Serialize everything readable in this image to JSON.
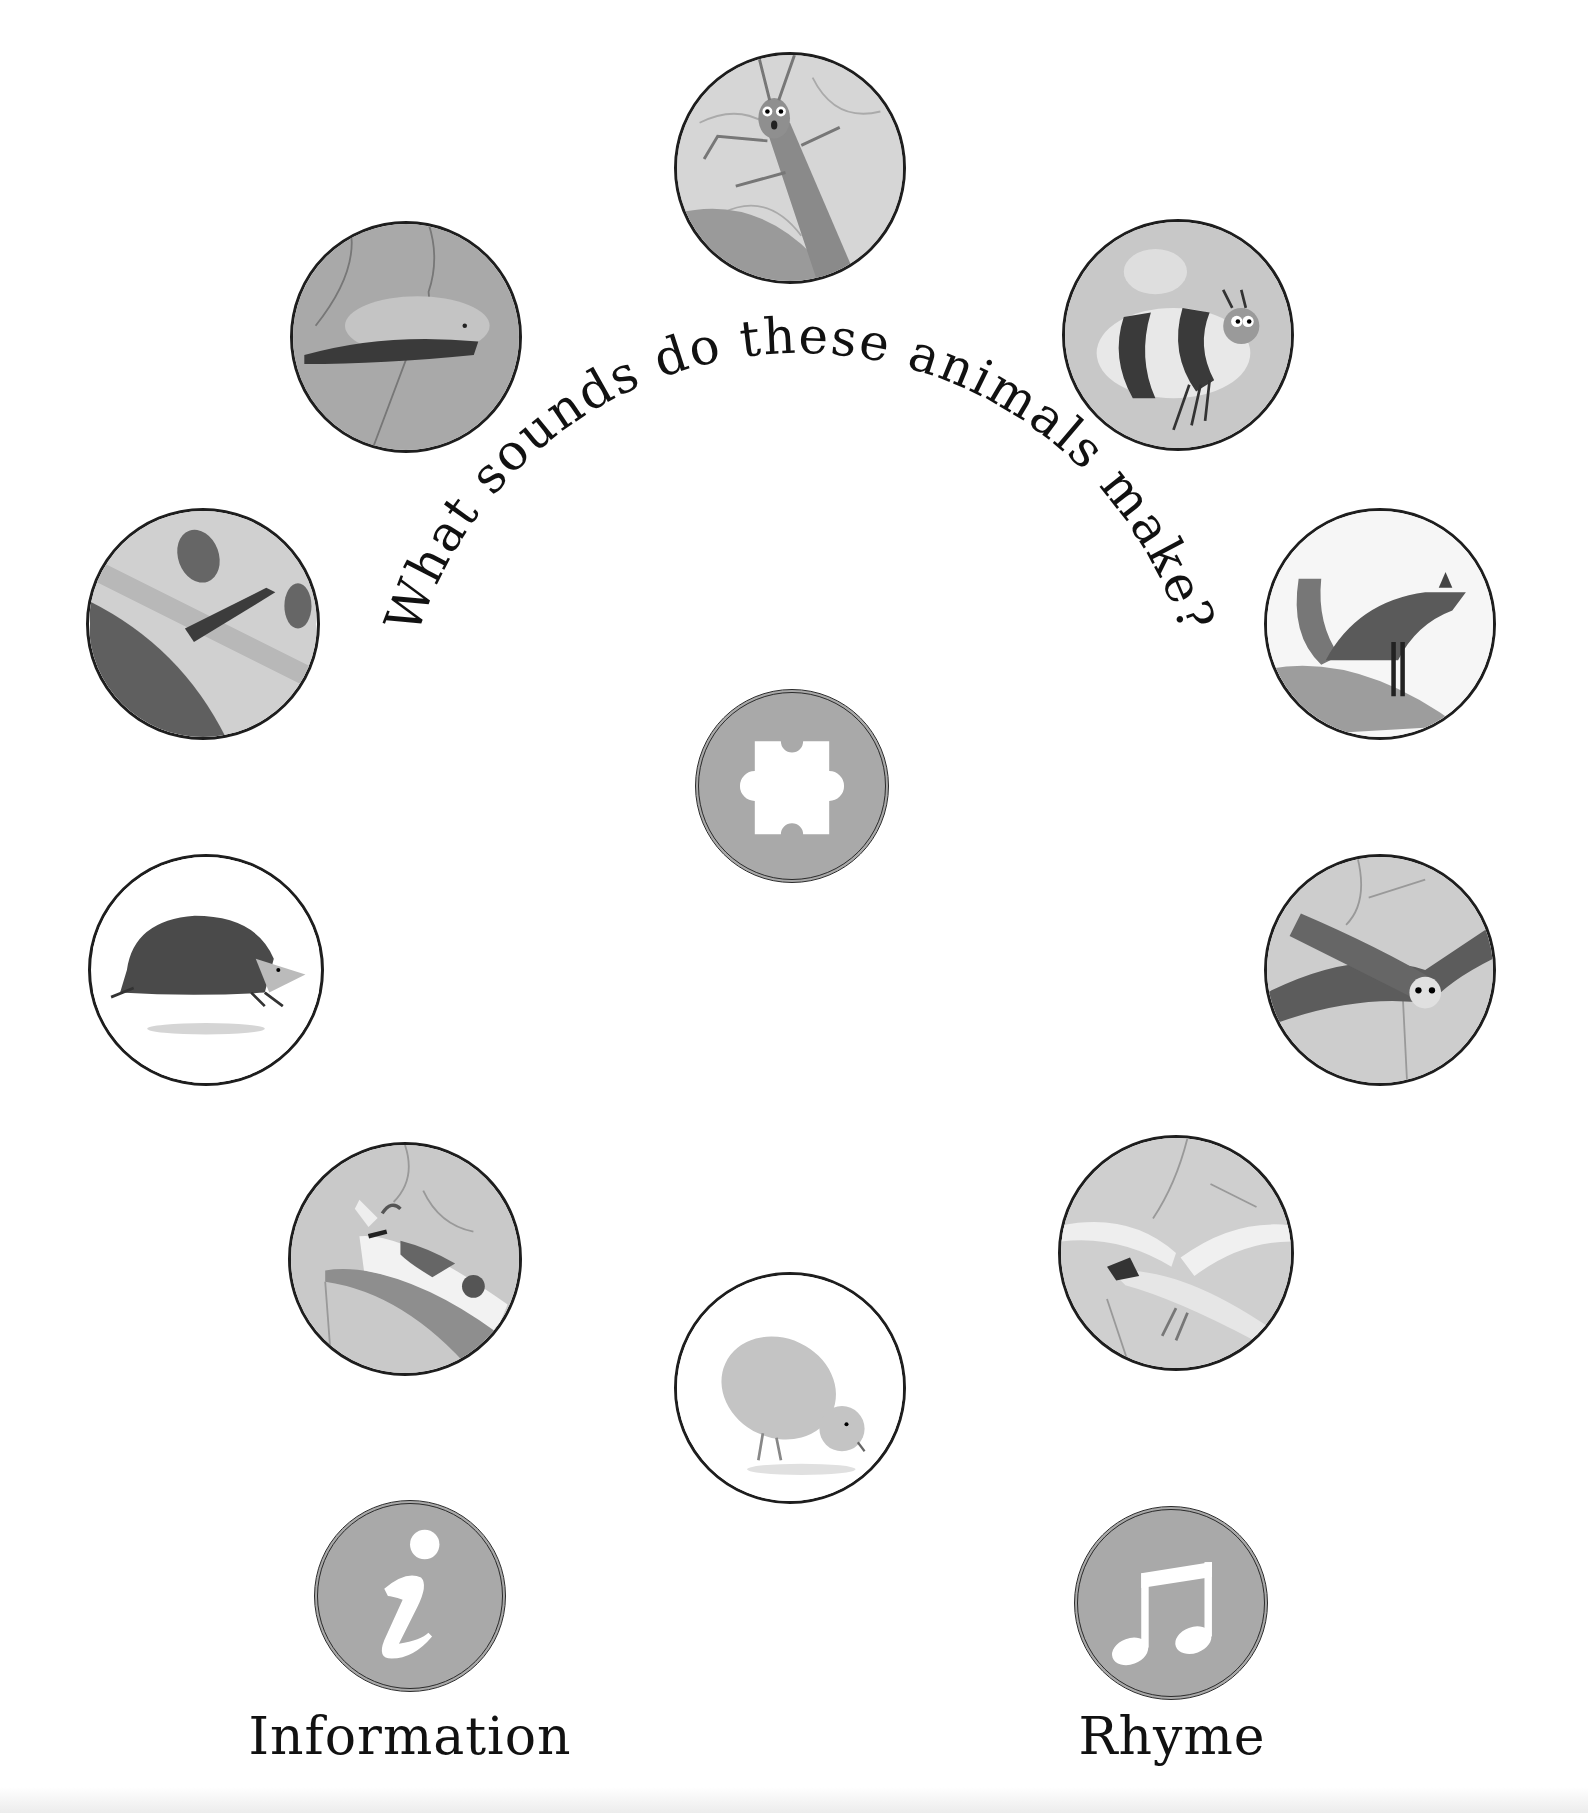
{
  "title": "What sounds do these animals make?",
  "animals": [
    {
      "name": "grasshopper",
      "alt": "Grasshopper"
    },
    {
      "name": "bee",
      "alt": "Bee"
    },
    {
      "name": "fox",
      "alt": "Fox"
    },
    {
      "name": "owl",
      "alt": "Owl"
    },
    {
      "name": "swan",
      "alt": "Swan"
    },
    {
      "name": "chick",
      "alt": "Chick"
    },
    {
      "name": "goat",
      "alt": "Goat"
    },
    {
      "name": "hedgehog",
      "alt": "Hedgehog"
    },
    {
      "name": "goose",
      "alt": "Goose"
    },
    {
      "name": "mouse",
      "alt": "Mouse"
    }
  ],
  "center_button": {
    "icon": "puzzle-icon",
    "alt": "Puzzle"
  },
  "buttons": {
    "information": {
      "label": "Information",
      "icon": "info-icon"
    },
    "rhyme": {
      "label": "Rhyme",
      "icon": "music-note-icon"
    }
  },
  "colors": {
    "button_fill": "#a9a9a9",
    "outline": "#1e1e1e",
    "text": "#111111",
    "background": "#ffffff"
  }
}
